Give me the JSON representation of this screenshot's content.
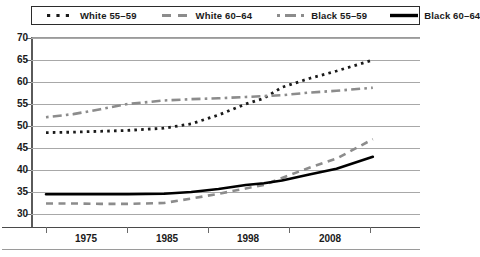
{
  "legend": {
    "entries": [
      {
        "label": "White 55–59",
        "style": "dotted",
        "color": "#1a1a1a"
      },
      {
        "label": "White 60–64",
        "style": "dashed",
        "color": "#8c8c8c"
      },
      {
        "label": "Black 55–59",
        "style": "dashdot",
        "color": "#8c8c8c"
      },
      {
        "label": "Black 60–64",
        "style": "solid",
        "color": "#000000"
      }
    ]
  },
  "axes": {
    "y_ticks": [
      "70",
      "65",
      "60",
      "55",
      "50",
      "45",
      "40",
      "35",
      "30"
    ],
    "x_ticks": [
      "1975",
      "1985",
      "1998",
      "2008"
    ]
  },
  "chart_data": {
    "type": "line",
    "title": "",
    "subtitle": "",
    "xlabel": "",
    "ylabel": "",
    "xlim": [
      1972,
      2010
    ],
    "ylim": [
      28,
      70
    ],
    "yticks": [
      30,
      35,
      40,
      45,
      50,
      55,
      60,
      65,
      70
    ],
    "xticks": [
      1975,
      1985,
      1998,
      2008
    ],
    "grid": "horizontal",
    "legend_position": "top",
    "x": [
      1972,
      1975,
      1978,
      1981,
      1985,
      1988,
      1991,
      1994,
      1996,
      1998,
      2001,
      2004,
      2008
    ],
    "series": [
      {
        "name": "White 55–59",
        "style": "dotted",
        "color": "#1a1a1a",
        "values": [
          48.5,
          48.6,
          48.8,
          49.0,
          49.5,
          50.5,
          52.5,
          55.0,
          56.3,
          58.8,
          60.8,
          62.5,
          65.0
        ]
      },
      {
        "name": "White 60–64",
        "style": "dashed",
        "color": "#8c8c8c",
        "values": [
          32.4,
          32.4,
          32.3,
          32.3,
          32.5,
          33.5,
          34.6,
          35.8,
          36.6,
          38.2,
          40.5,
          42.6,
          47.0
        ]
      },
      {
        "name": "Black 55–59",
        "style": "dashdot",
        "color": "#8c8c8c",
        "values": [
          52.0,
          52.7,
          53.8,
          55.0,
          55.8,
          56.1,
          56.3,
          56.6,
          56.8,
          57.0,
          57.6,
          58.0,
          58.7
        ]
      },
      {
        "name": "Black 60–64",
        "style": "solid",
        "color": "#000000",
        "values": [
          34.5,
          34.5,
          34.5,
          34.5,
          34.6,
          35.0,
          35.7,
          36.6,
          37.0,
          37.6,
          39.0,
          40.3,
          43.0
        ]
      }
    ]
  }
}
